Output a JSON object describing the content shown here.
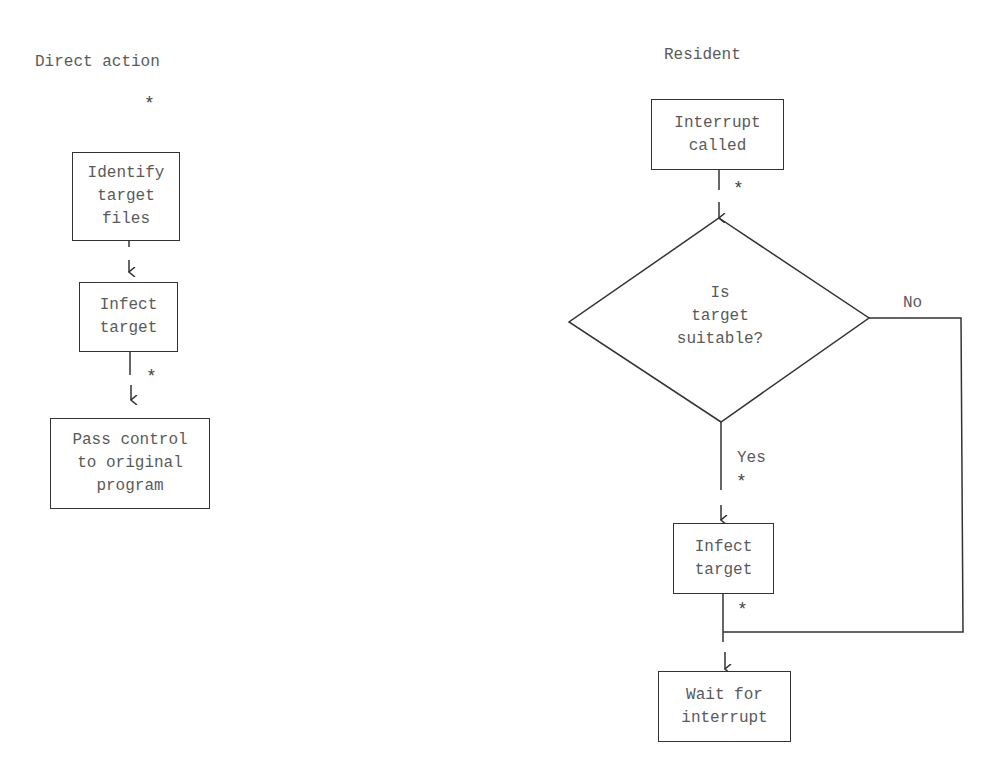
{
  "left_flow": {
    "title": "Direct action",
    "boxes": [
      {
        "lines": [
          "Identify",
          "target",
          "files"
        ]
      },
      {
        "lines": [
          "Infect",
          "target"
        ]
      },
      {
        "lines": [
          "Pass control",
          "to original",
          "program"
        ]
      }
    ],
    "markers": [
      "*",
      "*"
    ]
  },
  "right_flow": {
    "title": "Resident",
    "start_box": {
      "lines": [
        "Interrupt",
        "called"
      ]
    },
    "decision": {
      "lines": [
        "Is",
        "target",
        "suitable?"
      ]
    },
    "yes_label": "Yes",
    "no_label": "No",
    "infect_box": {
      "lines": [
        "Infect",
        "target"
      ]
    },
    "end_box": {
      "lines": [
        "Wait for",
        "interrupt"
      ]
    },
    "markers": [
      "*",
      "*",
      "*"
    ]
  },
  "colors": {
    "line": "#333333",
    "text": "#5a5a5a",
    "background": "#ffffff"
  }
}
